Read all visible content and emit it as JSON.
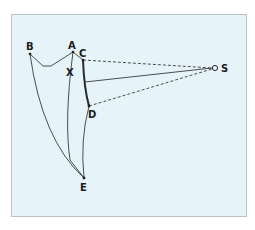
{
  "diagram": {
    "colors": {
      "background": "#e6f4f9",
      "frame_border": "#b9c3c7",
      "line": "#3a3a3a",
      "label": "#1c1c1c"
    },
    "points": {
      "A": {
        "label": "A"
      },
      "B": {
        "label": "B"
      },
      "C": {
        "label": "C"
      },
      "D": {
        "label": "D"
      },
      "E": {
        "label": "E"
      },
      "S": {
        "label": "S"
      },
      "X": {
        "label": "X"
      }
    }
  }
}
